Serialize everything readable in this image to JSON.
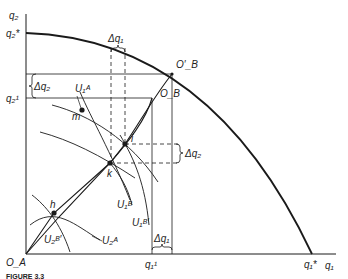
{
  "figure": {
    "caption": "FIGURE 3.3",
    "axes": {
      "y_label": "q₂",
      "x_label": "q₁",
      "origin_label": "O_A"
    },
    "ticks": {
      "q2_star": "q₂*",
      "q2_1": "q₂¹",
      "q1_1": "q₁¹",
      "q1_star": "q₁*"
    },
    "points": {
      "OB_prime": "O′_B",
      "OB": "O_B",
      "m": "m",
      "i": "i",
      "k": "k",
      "h": "h"
    },
    "curves": {
      "U1A": "U₁ᴬ",
      "U1B": "U₁ᴮ",
      "U1B_prime": "U₁ᴮ′",
      "U2B_prime": "U₂ᴮ′",
      "U2A": "U₂ᴬ"
    },
    "deltas": {
      "dq1_top": "Δq₁",
      "dq2_left": "Δq₂",
      "dq2_right": "Δq₂",
      "dq1_bottom": "Δq₁"
    },
    "colors": {
      "ink": "#1a1a1a",
      "background": "#ffffff"
    }
  }
}
